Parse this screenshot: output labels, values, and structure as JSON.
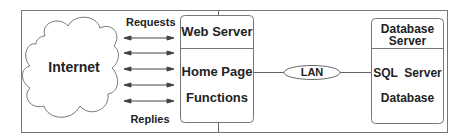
{
  "diagram": {
    "internet": {
      "label": "Internet"
    },
    "arrows": {
      "top_label": "Requests",
      "bottom_label": "Replies",
      "count": 5
    },
    "web_server": {
      "title": "Web Server",
      "items": [
        "Home Page",
        "Functions"
      ]
    },
    "lan": {
      "label": "LAN"
    },
    "database_server": {
      "title_line1": "Database",
      "title_line2": "Server",
      "items": [
        "SQL  Server",
        "Database"
      ]
    },
    "colors": {
      "stroke": "#666666",
      "text": "#222222",
      "background": "#ffffff"
    }
  }
}
